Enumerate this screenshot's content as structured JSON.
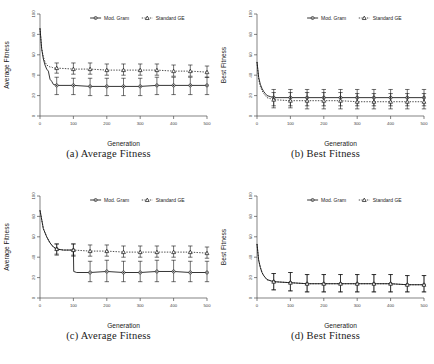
{
  "figure": {
    "panels": [
      {
        "id": "panel-a",
        "caption": "(a) Average Fitness",
        "chart_index": 0
      },
      {
        "id": "panel-b",
        "caption": "(b) Best Fitness",
        "chart_index": 1
      },
      {
        "id": "panel-c",
        "caption": "(c) Average Fitness",
        "chart_index": 2
      },
      {
        "id": "panel-d",
        "caption": "(d) Best Fitness",
        "chart_index": 3
      }
    ]
  },
  "chart_data": [
    {
      "type": "line",
      "title": "",
      "panel_label": "(a) Average Fitness",
      "xlabel": "Generation",
      "ylabel": "Average Fitness",
      "xlim": [
        0,
        500
      ],
      "ylim": [
        0,
        100
      ],
      "xticks": [
        0,
        100,
        200,
        300,
        400,
        500
      ],
      "yticks": [
        0,
        20,
        40,
        60,
        80,
        100
      ],
      "grid": false,
      "legend_position": "top-right",
      "legend": [
        "Mod. Gram",
        "Standard GE"
      ],
      "series": [
        {
          "name": "Mod. Gram",
          "line_style": "solid",
          "marker": "circle",
          "x": [
            0,
            5,
            10,
            15,
            20,
            25,
            30,
            35,
            40,
            50,
            100,
            150,
            200,
            250,
            300,
            350,
            400,
            450,
            500
          ],
          "values": [
            86,
            66,
            56,
            50,
            46,
            44,
            36,
            34,
            31,
            30,
            30,
            29,
            29,
            29,
            29,
            30,
            30,
            30,
            30
          ],
          "errorbar_x": [
            50,
            100,
            150,
            200,
            250,
            300,
            350,
            400,
            450,
            500
          ],
          "errorbar_y": [
            30,
            30,
            29,
            29,
            29,
            29,
            30,
            30,
            30,
            30
          ],
          "errorbar_upper": [
            38,
            37,
            37,
            37,
            37,
            37,
            38,
            38,
            38,
            38
          ],
          "errorbar_lower": [
            21,
            21,
            20,
            20,
            20,
            20,
            21,
            21,
            21,
            21
          ]
        },
        {
          "name": "Standard GE",
          "line_style": "dotted",
          "marker": "triangle",
          "x": [
            0,
            5,
            10,
            15,
            20,
            25,
            30,
            35,
            40,
            50,
            100,
            150,
            200,
            250,
            300,
            350,
            400,
            450,
            500
          ],
          "values": [
            86,
            66,
            58,
            53,
            50,
            49,
            48,
            48,
            47,
            47,
            46,
            46,
            45,
            45,
            45,
            45,
            44,
            44,
            43
          ],
          "errorbar_x": [
            50,
            100,
            150,
            200,
            250,
            300,
            350,
            400,
            450,
            500
          ],
          "errorbar_y": [
            47,
            46,
            46,
            45,
            45,
            45,
            45,
            44,
            44,
            43
          ],
          "errorbar_upper": [
            52,
            52,
            52,
            51,
            51,
            51,
            51,
            50,
            50,
            49
          ],
          "errorbar_lower": [
            42,
            41,
            41,
            40,
            40,
            40,
            40,
            39,
            39,
            38
          ]
        }
      ]
    },
    {
      "type": "line",
      "title": "",
      "panel_label": "(b) Best Fitness",
      "xlabel": "Generation",
      "ylabel": "Best Fitness",
      "xlim": [
        0,
        500
      ],
      "ylim": [
        0,
        100
      ],
      "xticks": [
        0,
        100,
        200,
        300,
        400,
        500
      ],
      "yticks": [
        0,
        20,
        40,
        60,
        80,
        100
      ],
      "grid": false,
      "legend_position": "top-right",
      "legend": [
        "Mod. Gram",
        "Standard GE"
      ],
      "series": [
        {
          "name": "Mod. Gram",
          "line_style": "solid",
          "marker": "circle",
          "x": [
            0,
            5,
            10,
            15,
            20,
            25,
            30,
            40,
            50,
            100,
            150,
            200,
            250,
            300,
            350,
            400,
            450,
            500
          ],
          "values": [
            53,
            38,
            31,
            27,
            24,
            22,
            20,
            19,
            18,
            18,
            18,
            18,
            18,
            18,
            18,
            18,
            18,
            18
          ],
          "errorbar_x": [
            50,
            100,
            150,
            200,
            250,
            300,
            350,
            400,
            450,
            500
          ],
          "errorbar_y": [
            18,
            18,
            18,
            18,
            18,
            18,
            18,
            18,
            18,
            18
          ],
          "errorbar_upper": [
            26,
            26,
            26,
            26,
            26,
            26,
            26,
            26,
            26,
            26
          ],
          "errorbar_lower": [
            10,
            10,
            10,
            10,
            10,
            10,
            10,
            10,
            10,
            10
          ]
        },
        {
          "name": "Standard GE",
          "line_style": "dotted",
          "marker": "triangle",
          "x": [
            0,
            5,
            10,
            15,
            20,
            25,
            30,
            40,
            50,
            100,
            150,
            200,
            250,
            300,
            350,
            400,
            450,
            500
          ],
          "values": [
            53,
            36,
            29,
            25,
            22,
            20,
            18,
            17,
            16,
            15,
            15,
            15,
            15,
            14,
            14,
            14,
            14,
            14
          ],
          "errorbar_x": [
            50,
            100,
            150,
            200,
            250,
            300,
            350,
            400,
            450,
            500
          ],
          "errorbar_y": [
            16,
            15,
            15,
            15,
            15,
            14,
            14,
            14,
            14,
            14
          ],
          "errorbar_upper": [
            23,
            23,
            23,
            23,
            23,
            22,
            22,
            22,
            22,
            22
          ],
          "errorbar_lower": [
            8,
            8,
            7,
            7,
            7,
            7,
            7,
            7,
            7,
            7
          ]
        }
      ]
    },
    {
      "type": "line",
      "title": "",
      "panel_label": "(c) Average Fitness",
      "xlabel": "Generation",
      "ylabel": "Average Fitness",
      "xlim": [
        0,
        500
      ],
      "ylim": [
        0,
        100
      ],
      "xticks": [
        0,
        100,
        200,
        300,
        400,
        500
      ],
      "yticks": [
        0,
        20,
        40,
        60,
        80,
        100
      ],
      "grid": false,
      "legend_position": "top-right",
      "legend": [
        "Mod. Gram",
        "Standard GE"
      ],
      "series": [
        {
          "name": "Mod. Gram",
          "line_style": "solid",
          "marker": "circle",
          "x": [
            0,
            10,
            20,
            30,
            40,
            50,
            70,
            90,
            99,
            100,
            101,
            110,
            150,
            200,
            250,
            300,
            350,
            400,
            450,
            500
          ],
          "values": [
            86,
            68,
            60,
            54,
            50,
            48,
            47,
            47,
            47,
            47,
            26,
            25,
            25,
            26,
            25,
            25,
            26,
            26,
            25,
            25
          ],
          "errorbar_x": [
            50,
            100,
            150,
            200,
            250,
            300,
            350,
            400,
            450,
            500
          ],
          "errorbar_y": [
            48,
            47,
            25,
            26,
            25,
            25,
            26,
            26,
            25,
            25
          ],
          "errorbar_upper": [
            53,
            53,
            36,
            37,
            36,
            36,
            37,
            37,
            36,
            36
          ],
          "errorbar_lower": [
            42,
            41,
            16,
            16,
            16,
            16,
            16,
            16,
            16,
            16
          ]
        },
        {
          "name": "Standard GE",
          "line_style": "dotted",
          "marker": "triangle",
          "x": [
            0,
            10,
            20,
            30,
            40,
            50,
            70,
            90,
            100,
            150,
            200,
            250,
            300,
            350,
            400,
            450,
            500
          ],
          "values": [
            86,
            68,
            60,
            54,
            50,
            48,
            47,
            47,
            47,
            46,
            46,
            45,
            45,
            45,
            45,
            45,
            44
          ],
          "errorbar_x": [
            50,
            100,
            150,
            200,
            250,
            300,
            350,
            400,
            450,
            500
          ],
          "errorbar_y": [
            48,
            47,
            46,
            46,
            45,
            45,
            45,
            45,
            45,
            44
          ],
          "errorbar_upper": [
            53,
            53,
            52,
            52,
            51,
            51,
            51,
            51,
            51,
            50
          ],
          "errorbar_lower": [
            43,
            42,
            41,
            41,
            40,
            40,
            40,
            40,
            40,
            39
          ]
        }
      ]
    },
    {
      "type": "line",
      "title": "",
      "panel_label": "(d) Best Fitness",
      "xlabel": "Generation",
      "ylabel": "Best Fitness",
      "xlim": [
        0,
        500
      ],
      "ylim": [
        0,
        100
      ],
      "xticks": [
        0,
        100,
        200,
        300,
        400,
        500
      ],
      "yticks": [
        0,
        20,
        40,
        60,
        80,
        100
      ],
      "grid": false,
      "legend_position": "top-right",
      "legend": [
        "Mod. Gram",
        "Standard GE"
      ],
      "series": [
        {
          "name": "Mod. Gram",
          "line_style": "solid",
          "marker": "circle",
          "x": [
            0,
            5,
            10,
            15,
            20,
            25,
            30,
            40,
            50,
            100,
            150,
            200,
            250,
            300,
            350,
            400,
            450,
            500
          ],
          "values": [
            53,
            37,
            30,
            25,
            22,
            20,
            18,
            17,
            16,
            15,
            14,
            14,
            14,
            14,
            14,
            14,
            13,
            13
          ],
          "errorbar_x": [
            50,
            100,
            150,
            200,
            250,
            300,
            350,
            400,
            450,
            500
          ],
          "errorbar_y": [
            16,
            15,
            14,
            14,
            14,
            14,
            14,
            14,
            13,
            13
          ],
          "errorbar_upper": [
            24,
            25,
            23,
            23,
            23,
            23,
            23,
            23,
            22,
            22
          ],
          "errorbar_lower": [
            8,
            7,
            6,
            6,
            6,
            6,
            6,
            6,
            6,
            6
          ]
        },
        {
          "name": "Standard GE",
          "line_style": "dotted",
          "marker": "triangle",
          "x": [
            0,
            5,
            10,
            15,
            20,
            25,
            30,
            40,
            50,
            100,
            150,
            200,
            250,
            300,
            350,
            400,
            450,
            500
          ],
          "values": [
            53,
            37,
            30,
            25,
            22,
            20,
            18,
            17,
            16,
            15,
            14,
            14,
            14,
            14,
            14,
            14,
            13,
            13
          ],
          "errorbar_x": [
            50,
            100,
            150,
            200,
            250,
            300,
            350,
            400,
            450,
            500
          ],
          "errorbar_y": [
            16,
            15,
            14,
            14,
            14,
            14,
            14,
            14,
            13,
            13
          ],
          "errorbar_upper": [
            24,
            25,
            23,
            23,
            23,
            23,
            23,
            23,
            22,
            22
          ],
          "errorbar_lower": [
            8,
            7,
            6,
            6,
            6,
            6,
            6,
            6,
            6,
            6
          ]
        }
      ]
    }
  ]
}
